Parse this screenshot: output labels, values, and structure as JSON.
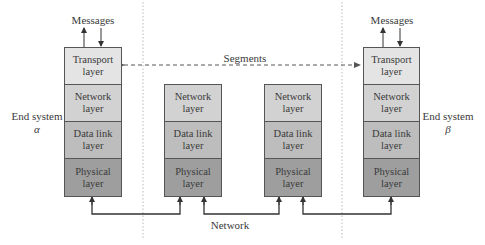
{
  "diagram": {
    "type": "network-protocol-stack",
    "colors": {
      "transport": "#e4e4e4",
      "network": "#d2d2d2",
      "datalink": "#bdbdbd",
      "physical": "#9e9e9e",
      "border": "#555555",
      "divider": "#bbbbbb",
      "arrow": "#333333"
    },
    "end_system_alpha": {
      "label": "End system",
      "symbol": "α",
      "messages_label": "Messages",
      "layers": [
        {
          "name": "transport",
          "text": "Transport\nlayer"
        },
        {
          "name": "network",
          "text": "Network\nlayer"
        },
        {
          "name": "datalink",
          "text": "Data link\nlayer"
        },
        {
          "name": "physical",
          "text": "Physical\nlayer"
        }
      ]
    },
    "router_1": {
      "layers": [
        {
          "name": "network",
          "text": "Network\nlayer"
        },
        {
          "name": "datalink",
          "text": "Data link\nlayer"
        },
        {
          "name": "physical",
          "text": "Physical\nlayer"
        }
      ]
    },
    "router_2": {
      "layers": [
        {
          "name": "network",
          "text": "Network\nlayer"
        },
        {
          "name": "datalink",
          "text": "Data link\nlayer"
        },
        {
          "name": "physical",
          "text": "Physical\nlayer"
        }
      ]
    },
    "end_system_beta": {
      "label": "End system",
      "symbol": "β",
      "messages_label": "Messages",
      "layers": [
        {
          "name": "transport",
          "text": "Transport\nlayer"
        },
        {
          "name": "network",
          "text": "Network\nlayer"
        },
        {
          "name": "datalink",
          "text": "Data link\nlayer"
        },
        {
          "name": "physical",
          "text": "Physical\nlayer"
        }
      ]
    },
    "segments_label": "Segments",
    "network_label": "Network"
  }
}
